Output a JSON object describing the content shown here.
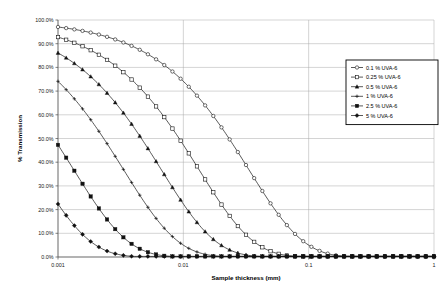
{
  "chart_data": {
    "type": "line",
    "title": "",
    "xlabel": "Sample thickness (mm)",
    "ylabel": "% Transmission",
    "xscale": "log",
    "xlim": [
      0.001,
      1
    ],
    "ylim": [
      0,
      1
    ],
    "grid": true,
    "legend_position": "right",
    "x_tick_labels": [
      "0.001",
      "0.01",
      "0.1",
      "1"
    ],
    "x_tick_values": [
      0.001,
      0.01,
      0.1,
      1
    ],
    "y_tick_labels": [
      "0.0%",
      "10.0%",
      "20.0%",
      "30.0%",
      "40.0%",
      "50.0%",
      "60.0%",
      "70.0%",
      "80.0%",
      "90.0%",
      "100.0%"
    ],
    "y_tick_values": [
      0,
      10,
      20,
      30,
      40,
      50,
      60,
      70,
      80,
      90,
      100
    ],
    "series": [
      {
        "name": "0.1 %  UVA-6",
        "concentration": 0.1,
        "marker": "open-circle",
        "absorbance_per_mm": 13.0,
        "x": [
          0.001,
          0.0013,
          0.0016,
          0.002,
          0.0025,
          0.0032,
          0.004,
          0.005,
          0.0063,
          0.008,
          0.01,
          0.013,
          0.016,
          0.02,
          0.025,
          0.032,
          0.04,
          0.05,
          0.063,
          0.08,
          0.1,
          0.13,
          0.16,
          0.2,
          0.25,
          0.32,
          0.4,
          0.5,
          0.63,
          0.8,
          1.0
        ],
        "values": [
          97.1,
          96.2,
          95.3,
          94.2,
          92.8,
          90.9,
          88.8,
          86.2,
          83.0,
          78.9,
          74.5,
          68.3,
          62.2,
          55.0,
          47.5,
          38.4,
          30.4,
          22.6,
          15.3,
          9.0,
          5.3,
          2.1,
          0.9,
          0.3,
          0.1,
          0.0,
          0.0,
          0.0,
          0.0,
          0.0,
          0.0
        ]
      },
      {
        "name": "0.25 % UVA-6",
        "concentration": 0.25,
        "marker": "open-square",
        "absorbance_per_mm": 32.5,
        "x": [
          0.001,
          0.0013,
          0.0016,
          0.002,
          0.0025,
          0.0032,
          0.004,
          0.005,
          0.0063,
          0.008,
          0.01,
          0.013,
          0.016,
          0.02,
          0.025,
          0.032,
          0.04,
          0.05,
          0.063,
          0.08,
          0.1,
          0.13,
          0.16,
          0.2,
          0.25,
          0.32,
          0.4,
          0.5,
          0.63,
          0.8,
          1.0
        ],
        "values": [
          92.8,
          90.8,
          88.8,
          86.2,
          83.0,
          78.9,
          74.5,
          68.3,
          62.2,
          55.0,
          47.5,
          38.4,
          30.4,
          22.6,
          15.3,
          9.0,
          5.3,
          2.1,
          0.9,
          0.3,
          0.1,
          0.0,
          0.0,
          0.0,
          0.0,
          0.0,
          0.0,
          0.0,
          0.0,
          0.0,
          0.0
        ]
      },
      {
        "name": "0.5 %  UVA-6",
        "concentration": 0.5,
        "marker": "filled-triangle",
        "absorbance_per_mm": 65.0,
        "x": [
          0.001,
          0.0013,
          0.0016,
          0.002,
          0.0025,
          0.0032,
          0.004,
          0.005,
          0.0063,
          0.008,
          0.01,
          0.013,
          0.016,
          0.02,
          0.025,
          0.032,
          0.04,
          0.05,
          0.063,
          0.08,
          0.1,
          0.13,
          0.16,
          0.2,
          0.25,
          0.32,
          0.4,
          0.5,
          0.63,
          0.8,
          1.0
        ],
        "values": [
          86.1,
          82.4,
          78.8,
          74.2,
          68.8,
          62.0,
          55.1,
          46.5,
          38.5,
          30.1,
          22.4,
          14.9,
          9.6,
          5.5,
          2.8,
          1.1,
          0.4,
          0.1,
          0.0,
          0.0,
          0.0,
          0.0,
          0.0,
          0.0,
          0.0,
          0.0,
          0.0,
          0.0,
          0.0,
          0.0,
          0.0
        ]
      },
      {
        "name": "1 %  UVA-6",
        "concentration": 1,
        "marker": "plus-cross",
        "absorbance_per_mm": 130.0,
        "x": [
          0.001,
          0.0013,
          0.0016,
          0.002,
          0.0025,
          0.0032,
          0.004,
          0.005,
          0.0063,
          0.008,
          0.01,
          0.013,
          0.016,
          0.02,
          0.025,
          0.032,
          0.04,
          0.05,
          0.063,
          0.08,
          0.1,
          0.13,
          0.16,
          0.2,
          0.25,
          0.32,
          0.4,
          0.5,
          0.63,
          0.8,
          1.0
        ],
        "values": [
          74.1,
          67.9,
          62.1,
          55.1,
          47.4,
          38.5,
          30.4,
          21.6,
          14.8,
          9.1,
          5.0,
          2.2,
          0.9,
          0.3,
          0.1,
          0.0,
          0.0,
          0.0,
          0.0,
          0.0,
          0.0,
          0.0,
          0.0,
          0.0,
          0.0,
          0.0,
          0.0,
          0.0,
          0.0,
          0.0,
          0.0
        ]
      },
      {
        "name": "2.5 %  UVA-6",
        "concentration": 2.5,
        "marker": "filled-square",
        "absorbance_per_mm": 325.0,
        "x": [
          0.001,
          0.0013,
          0.0016,
          0.002,
          0.0025,
          0.0032,
          0.004,
          0.005,
          0.0063,
          0.008,
          0.01,
          0.013,
          0.016,
          0.02,
          0.025,
          0.032,
          0.04,
          0.05,
          0.063,
          0.08,
          0.1,
          0.13,
          0.16,
          0.2,
          0.25,
          0.32,
          0.4,
          0.5,
          0.63,
          0.8,
          1.0
        ],
        "values": [
          47.3,
          38.2,
          30.3,
          22.4,
          15.2,
          9.0,
          5.1,
          2.3,
          0.9,
          0.3,
          0.1,
          0.0,
          0.0,
          0.0,
          0.0,
          0.0,
          0.0,
          0.0,
          0.0,
          0.0,
          0.0,
          0.0,
          0.0,
          0.0,
          0.0,
          0.0,
          0.0,
          0.0,
          0.0,
          0.0,
          0.0
        ]
      },
      {
        "name": "5 %  UVA-6",
        "concentration": 5,
        "marker": "filled-diamond",
        "absorbance_per_mm": 650.0,
        "x": [
          0.001,
          0.0013,
          0.0016,
          0.002,
          0.0025,
          0.0032,
          0.004,
          0.005,
          0.0063,
          0.008,
          0.01,
          0.013,
          0.016,
          0.02,
          0.025,
          0.032,
          0.04,
          0.05,
          0.063,
          0.08,
          0.1,
          0.13,
          0.16,
          0.2,
          0.25,
          0.32,
          0.4,
          0.5,
          0.63,
          0.8,
          1.0
        ],
        "values": [
          22.3,
          14.6,
          9.2,
          5.0,
          2.3,
          0.8,
          0.3,
          0.1,
          0.0,
          0.0,
          0.0,
          0.0,
          0.0,
          0.0,
          0.0,
          0.0,
          0.0,
          0.0,
          0.0,
          0.0,
          0.0,
          0.0,
          0.0,
          0.0,
          0.0,
          0.0,
          0.0,
          0.0,
          0.0,
          0.0,
          0.0
        ]
      }
    ]
  },
  "legend": {
    "entries": [
      "0.1 %  UVA-6",
      "0.25 % UVA-6",
      "0.5 %  UVA-6",
      "1 %  UVA-6",
      "2.5 %  UVA-6",
      "5 %  UVA-6"
    ]
  },
  "colors": {
    "line": "#111111",
    "grid": "#a9a9a9",
    "axis": "#4d4d4d",
    "background": "#ffffff",
    "text": "#000000"
  }
}
